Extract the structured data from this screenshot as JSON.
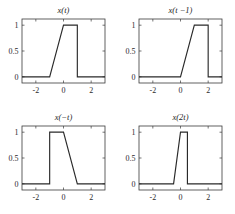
{
  "figure": {
    "background_color": "#ffffff",
    "line_color": "#2a2a2a",
    "axis_color": "#3b3b3b",
    "rows": 2,
    "cols": 2
  },
  "chart_data": [
    {
      "type": "line",
      "title": "x(t)",
      "xlabel": "",
      "ylabel": "",
      "xlim": [
        -3,
        3
      ],
      "ylim": [
        -0.12,
        1.12
      ],
      "xticks": [
        -2,
        0,
        2
      ],
      "xticklabels": [
        "-2",
        "0",
        "2"
      ],
      "yticks": [
        0,
        0.5,
        1
      ],
      "yticklabels": [
        "0",
        "0.5",
        "1"
      ],
      "grid": false,
      "legend": "none",
      "x": [
        -3,
        -1,
        0,
        1,
        1,
        3
      ],
      "y": [
        0,
        0,
        1,
        1,
        0,
        0
      ],
      "description": "ramp up from t=-1 to t=0, flat at 1 until t=1, vertical drop to 0"
    },
    {
      "type": "line",
      "title": "x(t −1)",
      "xlabel": "",
      "ylabel": "",
      "xlim": [
        -3,
        3
      ],
      "ylim": [
        -0.12,
        1.12
      ],
      "xticks": [
        -2,
        0,
        2
      ],
      "xticklabels": [
        "-2",
        "0",
        "2"
      ],
      "yticks": [
        0,
        0.5,
        1
      ],
      "yticklabels": [
        "0",
        "0.5",
        "1"
      ],
      "grid": false,
      "legend": "none",
      "x": [
        -3,
        0,
        1,
        2,
        2,
        3
      ],
      "y": [
        0,
        0,
        1,
        1,
        0,
        0
      ],
      "description": "time shift right by 1: ramp from t=0 to t=1, flat to t=2, vertical drop"
    },
    {
      "type": "line",
      "title": "x(−t)",
      "xlabel": "",
      "ylabel": "",
      "xlim": [
        -3,
        3
      ],
      "ylim": [
        -0.12,
        1.12
      ],
      "xticks": [
        -2,
        0,
        2
      ],
      "xticklabels": [
        "-2",
        "0",
        "2"
      ],
      "yticks": [
        0,
        0.5,
        1
      ],
      "yticklabels": [
        "0",
        "0.5",
        "1"
      ],
      "grid": false,
      "legend": "none",
      "x": [
        -3,
        -1,
        -1,
        0,
        1,
        3
      ],
      "y": [
        0,
        0,
        1,
        1,
        0,
        0
      ],
      "description": "time reversal: vertical rise at t=-1, flat to t=0, ramp down to 0 at t=1"
    },
    {
      "type": "line",
      "title": "x(2t)",
      "xlabel": "",
      "ylabel": "",
      "xlim": [
        -3,
        3
      ],
      "ylim": [
        -0.12,
        1.12
      ],
      "xticks": [
        -2,
        0,
        2
      ],
      "xticklabels": [
        "-2",
        "0",
        "2"
      ],
      "yticks": [
        0,
        0.5,
        1
      ],
      "yticklabels": [
        "0",
        "0.5",
        "1"
      ],
      "grid": false,
      "legend": "none",
      "x": [
        -3,
        -0.5,
        0,
        0.5,
        0.5,
        3
      ],
      "y": [
        0,
        0,
        1,
        1,
        0,
        0
      ],
      "description": "time compression by 2: ramp from t=-0.5 to t=0, flat to t=0.5, vertical drop"
    }
  ]
}
